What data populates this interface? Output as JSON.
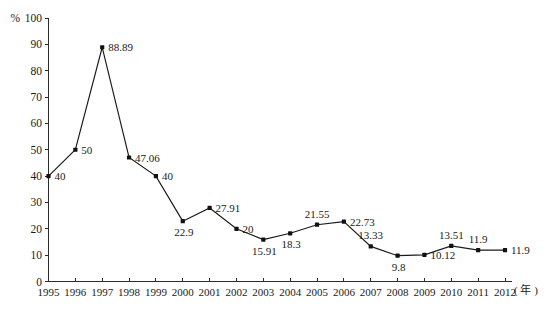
{
  "chart_data": {
    "type": "line",
    "title": "",
    "subtitle": "",
    "xlabel": "年",
    "ylabel": "%",
    "x": [
      "1995",
      "1996",
      "1997",
      "1998",
      "1999",
      "2000",
      "2001",
      "2002",
      "2003",
      "2004",
      "2005",
      "2006",
      "2007",
      "2008",
      "2009",
      "2010",
      "2011",
      "2012"
    ],
    "categories": [
      "1995",
      "1996",
      "1997",
      "1998",
      "1999",
      "2000",
      "2001",
      "2002",
      "2003",
      "2004",
      "2005",
      "2006",
      "2007",
      "2008",
      "2009",
      "2010",
      "2011",
      "2012"
    ],
    "values": [
      40,
      50,
      88.89,
      47.06,
      40,
      22.9,
      27.91,
      20,
      15.91,
      18.3,
      21.55,
      22.73,
      13.33,
      9.8,
      10.12,
      13.51,
      11.9,
      11.9
    ],
    "point_labels": [
      "40",
      "50",
      "88.89",
      "47.06",
      "40",
      "22.9",
      "27.91",
      "20",
      "15.91",
      "18.3",
      "21.55",
      "22.73",
      "13.33",
      "9.8",
      "10.12",
      "13.51",
      "11.9",
      "11.9"
    ],
    "series": [
      {
        "name": "",
        "values": [
          40,
          50,
          88.89,
          47.06,
          40,
          22.9,
          27.91,
          20,
          15.91,
          18.3,
          21.55,
          22.73,
          13.33,
          9.8,
          10.12,
          13.51,
          11.9,
          11.9
        ]
      }
    ],
    "label_placement": [
      "right",
      "right",
      "right",
      "right",
      "right",
      "below",
      "right",
      "right",
      "below",
      "below",
      "above",
      "right",
      "above",
      "below",
      "right",
      "above",
      "above",
      "right"
    ],
    "ylim": [
      0,
      100
    ],
    "y_ticks": [
      "0",
      "10",
      "20",
      "30",
      "40",
      "50",
      "60",
      "70",
      "80",
      "90",
      "100"
    ],
    "y_tick_values": [
      0,
      10,
      20,
      30,
      40,
      50,
      60,
      70,
      80,
      90,
      100
    ],
    "y_unit_label": "%",
    "x_unit_label": "( 年 )",
    "grid": false,
    "legend": "none",
    "line_color": "#1a1a1a",
    "marker_color": "#111111",
    "axis_color": "#2b2b2b",
    "background_color": "#ffffff"
  }
}
